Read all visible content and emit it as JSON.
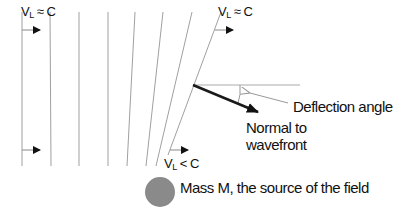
{
  "diagram": {
    "labels": {
      "velocity_left": {
        "v": "V",
        "sub": "L",
        "rel": "≈ C"
      },
      "velocity_right": {
        "v": "V",
        "sub": "L",
        "rel": "≈ C"
      },
      "velocity_near_mass": {
        "v": "V",
        "sub": "L",
        "rel": "< C"
      },
      "deflection_angle": "Deflection angle",
      "normal_line1": "Normal to",
      "normal_line2": "wavefront",
      "mass": "Mass M, the source of the field"
    },
    "colors": {
      "wavefront_lines": "#9a9a9a",
      "normal_arrow": "#1a1a1a",
      "mass_fill": "#8a8a8a",
      "text": "#111111"
    }
  }
}
